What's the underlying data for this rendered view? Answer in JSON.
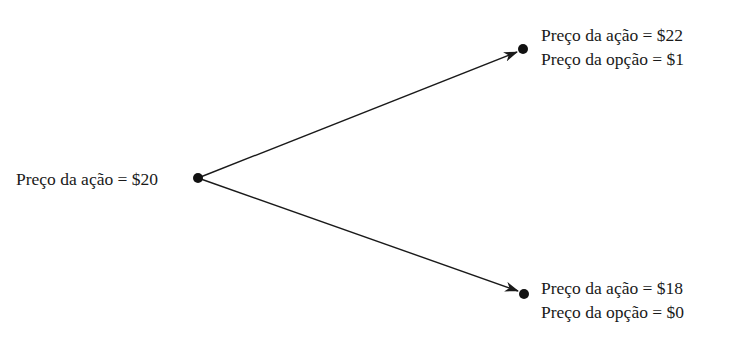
{
  "diagram": {
    "type": "binomial-tree",
    "colors": {
      "line": "#1a1a1a",
      "text": "#1a1a1a",
      "background": "#ffffff"
    },
    "root": {
      "stock_price_label": "Preço da ação = $20",
      "position": [
        198,
        178
      ]
    },
    "up": {
      "stock_price_label": "Preço da ação = $22",
      "option_price_label": "Preço da opção = $1",
      "position": [
        523,
        49
      ]
    },
    "down": {
      "stock_price_label": "Preço da ação = $18",
      "option_price_label": "Preço da opção = $0",
      "position": [
        524,
        294
      ]
    }
  }
}
